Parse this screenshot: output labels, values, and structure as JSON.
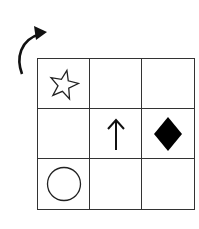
{
  "diagram": {
    "rotation_indicator": {
      "icon": "clockwise-curved-arrow-icon",
      "direction": "clockwise"
    },
    "grid": {
      "rows": 3,
      "cols": 3,
      "cells": [
        [
          "star-outline",
          "",
          ""
        ],
        [
          "",
          "up-arrow",
          "filled-diamond"
        ],
        [
          "circle-outline",
          "",
          ""
        ]
      ]
    },
    "colors": {
      "line": "#333333",
      "fill": "#000000",
      "background": "#ffffff"
    }
  }
}
